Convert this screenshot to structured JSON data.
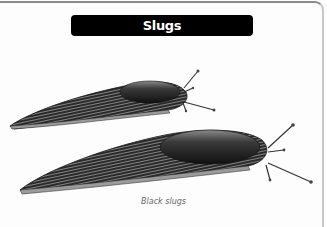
{
  "title": "Slugs",
  "illustration": {
    "subject": "Two black slugs drawn in engraving style, crawling to the right",
    "slugs": [
      {
        "name": "upper-slug"
      },
      {
        "name": "lower-slug"
      }
    ]
  },
  "caption": "Black slugs"
}
